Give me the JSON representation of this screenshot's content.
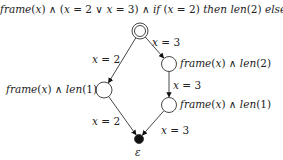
{
  "title": {
    "parts": [
      {
        "text": "frame",
        "italic": true
      },
      {
        "text": "(",
        "italic": false
      },
      {
        "text": "x",
        "italic": true
      },
      {
        "text": ") ∧ (",
        "italic": false
      },
      {
        "text": "x",
        "italic": true
      },
      {
        "text": " = 2 ∨ ",
        "italic": false
      },
      {
        "text": "x",
        "italic": true
      },
      {
        "text": " = 3) ∧ ",
        "italic": false
      },
      {
        "text": "if",
        "italic": true
      },
      {
        "text": " (",
        "italic": false
      },
      {
        "text": "x",
        "italic": true
      },
      {
        "text": " = 2) ",
        "italic": false
      },
      {
        "text": "then len",
        "italic": true
      },
      {
        "text": "(2) ",
        "italic": false
      },
      {
        "text": "else",
        "italic": true
      },
      {
        "text": " {",
        "italic": false
      },
      {
        "text": "len",
        "italic": true
      },
      {
        "text": "(3)}",
        "italic": false
      }
    ]
  },
  "nodes": [
    {
      "id": "start",
      "type": "double",
      "cx": 140,
      "cy": 31,
      "r": 8
    },
    {
      "id": "left",
      "type": "plain",
      "cx": 104,
      "cy": 90,
      "r": 8
    },
    {
      "id": "right1",
      "type": "plain",
      "cx": 169,
      "cy": 64,
      "r": 7.5
    },
    {
      "id": "right2",
      "type": "plain",
      "cx": 169,
      "cy": 105,
      "r": 7.5
    },
    {
      "id": "end",
      "type": "final",
      "cx": 139,
      "cy": 139,
      "r": 4.5
    }
  ],
  "node_labels": {
    "left": "frame(x) ∧ len(1)",
    "right1": "frame(x) ∧ len(2)",
    "right2": "frame(x) ∧ len(1)",
    "end": "ε"
  },
  "edges": [
    {
      "from": "start",
      "to": "left",
      "label": "x = 2"
    },
    {
      "from": "start",
      "to": "right1",
      "label": "x = 3"
    },
    {
      "from": "right1",
      "to": "right2",
      "label": "x = 3"
    },
    {
      "from": "left",
      "to": "end",
      "label": "x = 2"
    },
    {
      "from": "right2",
      "to": "end",
      "label": "x = 3"
    }
  ],
  "colors": {
    "stroke": "#333333",
    "fill_final": "#111111",
    "text": "#222222"
  }
}
